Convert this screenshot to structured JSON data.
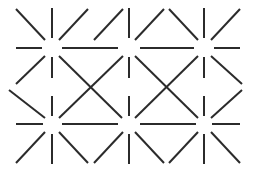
{
  "figure": {
    "background_color": "#ffffff",
    "line_color": "#2b2b2b",
    "line_width": 2,
    "canvas": {
      "width": 257,
      "height": 174
    }
  },
  "chart_data": {
    "type": "scatter",
    "xlabel": "",
    "ylabel": "",
    "xlim": [
      0,
      257
    ],
    "ylim": [
      0,
      174
    ],
    "grid": false,
    "legend": "none",
    "node_columns_x": [
      11,
      52,
      129,
      204,
      245
    ],
    "node_rows_y": [
      48,
      87,
      124
    ],
    "inner_gap_radius": 9,
    "nodes": [
      {
        "id": "n-left-mid",
        "x": 11,
        "y": 87,
        "directions": [
          "up-right",
          "down-right"
        ]
      },
      {
        "id": "n-c1-top",
        "x": 52,
        "y": 48,
        "directions": [
          "up-left",
          "up",
          "up-right",
          "left",
          "right",
          "down-left",
          "down",
          "down-right"
        ]
      },
      {
        "id": "n-c1-mid",
        "x": 52,
        "y": 87,
        "directions": [
          "up-left",
          "up",
          "up-right",
          "down-left",
          "down",
          "down-right"
        ]
      },
      {
        "id": "n-c1-bot",
        "x": 52,
        "y": 124,
        "directions": [
          "up-left",
          "up",
          "up-right",
          "left",
          "right",
          "down-left",
          "down",
          "down-right"
        ]
      },
      {
        "id": "n-c2-top",
        "x": 129,
        "y": 48,
        "directions": [
          "up-left",
          "up",
          "up-right",
          "left",
          "right",
          "down-left",
          "down",
          "down-right"
        ]
      },
      {
        "id": "n-c2-mid",
        "x": 129,
        "y": 87,
        "directions": [
          "up-left",
          "up",
          "up-right",
          "down-left",
          "down",
          "down-right"
        ]
      },
      {
        "id": "n-c2-bot",
        "x": 129,
        "y": 124,
        "directions": [
          "up-left",
          "up",
          "up-right",
          "left",
          "right",
          "down-left",
          "down",
          "down-right"
        ]
      },
      {
        "id": "n-c3-top",
        "x": 204,
        "y": 48,
        "directions": [
          "up-left",
          "up",
          "up-right",
          "left",
          "right",
          "down-left",
          "down",
          "down-right"
        ]
      },
      {
        "id": "n-c3-mid",
        "x": 204,
        "y": 87,
        "directions": [
          "up-left",
          "up",
          "up-right",
          "down-left",
          "down",
          "down-right"
        ]
      },
      {
        "id": "n-c3-bot",
        "x": 204,
        "y": 124,
        "directions": [
          "up-left",
          "up",
          "up-right",
          "left",
          "right",
          "down-left",
          "down",
          "down-right"
        ]
      },
      {
        "id": "n-right-mid",
        "x": 245,
        "y": 87,
        "directions": [
          "up-left",
          "down-left"
        ]
      }
    ],
    "segments": [
      {
        "id": "s01",
        "x1": 16,
        "y1": 9,
        "x2": 45,
        "y2": 40,
        "orientation": "diagonal-nwse"
      },
      {
        "id": "s02",
        "x1": 52,
        "y1": 8,
        "x2": 52,
        "y2": 38,
        "orientation": "vertical"
      },
      {
        "id": "s03",
        "x1": 88,
        "y1": 9,
        "x2": 59,
        "y2": 40,
        "orientation": "diagonal-swne"
      },
      {
        "id": "s04",
        "x1": 94,
        "y1": 40,
        "x2": 123,
        "y2": 9,
        "orientation": "diagonal-swne"
      },
      {
        "id": "s05",
        "x1": 129,
        "y1": 8,
        "x2": 129,
        "y2": 38,
        "orientation": "vertical"
      },
      {
        "id": "s06",
        "x1": 135,
        "y1": 40,
        "x2": 164,
        "y2": 9,
        "orientation": "diagonal-nwse"
      },
      {
        "id": "s07",
        "x1": 169,
        "y1": 9,
        "x2": 198,
        "y2": 40,
        "orientation": "diagonal-nwse"
      },
      {
        "id": "s08",
        "x1": 204,
        "y1": 8,
        "x2": 204,
        "y2": 38,
        "orientation": "vertical"
      },
      {
        "id": "s09",
        "x1": 240,
        "y1": 9,
        "x2": 211,
        "y2": 40,
        "orientation": "diagonal-swne"
      },
      {
        "id": "s10",
        "x1": 16,
        "y1": 48,
        "x2": 42,
        "y2": 48,
        "orientation": "horizontal"
      },
      {
        "id": "s11",
        "x1": 62,
        "y1": 48,
        "x2": 118,
        "y2": 48,
        "orientation": "horizontal"
      },
      {
        "id": "s12",
        "x1": 140,
        "y1": 48,
        "x2": 194,
        "y2": 48,
        "orientation": "horizontal"
      },
      {
        "id": "s13",
        "x1": 214,
        "y1": 48,
        "x2": 240,
        "y2": 48,
        "orientation": "horizontal"
      },
      {
        "id": "s14",
        "x1": 45,
        "y1": 56,
        "x2": 16,
        "y2": 84,
        "orientation": "diagonal-swne"
      },
      {
        "id": "s15",
        "x1": 52,
        "y1": 57,
        "x2": 52,
        "y2": 78,
        "orientation": "vertical"
      },
      {
        "id": "s16",
        "x1": 59,
        "y1": 56,
        "x2": 122,
        "y2": 118,
        "orientation": "diagonal-nwse"
      },
      {
        "id": "s17",
        "x1": 123,
        "y1": 56,
        "x2": 59,
        "y2": 118,
        "orientation": "diagonal-swne"
      },
      {
        "id": "s18",
        "x1": 129,
        "y1": 57,
        "x2": 129,
        "y2": 78,
        "orientation": "vertical"
      },
      {
        "id": "s19",
        "x1": 135,
        "y1": 56,
        "x2": 198,
        "y2": 118,
        "orientation": "diagonal-nwse"
      },
      {
        "id": "s20",
        "x1": 198,
        "y1": 56,
        "x2": 135,
        "y2": 118,
        "orientation": "diagonal-swne"
      },
      {
        "id": "s21",
        "x1": 204,
        "y1": 57,
        "x2": 204,
        "y2": 78,
        "orientation": "vertical"
      },
      {
        "id": "s22",
        "x1": 211,
        "y1": 56,
        "x2": 242,
        "y2": 84,
        "orientation": "diagonal-nwse"
      },
      {
        "id": "s23",
        "x1": 9,
        "y1": 90,
        "x2": 45,
        "y2": 118,
        "orientation": "diagonal-nwse"
      },
      {
        "id": "s24",
        "x1": 52,
        "y1": 96,
        "x2": 52,
        "y2": 116,
        "orientation": "vertical"
      },
      {
        "id": "s25",
        "x1": 129,
        "y1": 96,
        "x2": 129,
        "y2": 116,
        "orientation": "vertical"
      },
      {
        "id": "s26",
        "x1": 204,
        "y1": 96,
        "x2": 204,
        "y2": 116,
        "orientation": "vertical"
      },
      {
        "id": "s27",
        "x1": 242,
        "y1": 90,
        "x2": 211,
        "y2": 118,
        "orientation": "diagonal-swne"
      },
      {
        "id": "s28",
        "x1": 16,
        "y1": 124,
        "x2": 43,
        "y2": 124,
        "orientation": "horizontal"
      },
      {
        "id": "s29",
        "x1": 62,
        "y1": 124,
        "x2": 118,
        "y2": 124,
        "orientation": "horizontal"
      },
      {
        "id": "s30",
        "x1": 140,
        "y1": 124,
        "x2": 196,
        "y2": 124,
        "orientation": "horizontal"
      },
      {
        "id": "s31",
        "x1": 212,
        "y1": 124,
        "x2": 240,
        "y2": 124,
        "orientation": "horizontal"
      },
      {
        "id": "s32",
        "x1": 45,
        "y1": 132,
        "x2": 16,
        "y2": 163,
        "orientation": "diagonal-swne"
      },
      {
        "id": "s33",
        "x1": 52,
        "y1": 134,
        "x2": 52,
        "y2": 164,
        "orientation": "vertical"
      },
      {
        "id": "s34",
        "x1": 59,
        "y1": 132,
        "x2": 88,
        "y2": 163,
        "orientation": "diagonal-nwse"
      },
      {
        "id": "s35",
        "x1": 123,
        "y1": 132,
        "x2": 94,
        "y2": 163,
        "orientation": "diagonal-swne"
      },
      {
        "id": "s36",
        "x1": 129,
        "y1": 134,
        "x2": 129,
        "y2": 164,
        "orientation": "vertical"
      },
      {
        "id": "s37",
        "x1": 135,
        "y1": 132,
        "x2": 164,
        "y2": 163,
        "orientation": "diagonal-nwse"
      },
      {
        "id": "s38",
        "x1": 198,
        "y1": 132,
        "x2": 169,
        "y2": 163,
        "orientation": "diagonal-swne"
      },
      {
        "id": "s39",
        "x1": 204,
        "y1": 134,
        "x2": 204,
        "y2": 164,
        "orientation": "vertical"
      },
      {
        "id": "s40",
        "x1": 211,
        "y1": 132,
        "x2": 240,
        "y2": 163,
        "orientation": "diagonal-nwse"
      }
    ]
  }
}
